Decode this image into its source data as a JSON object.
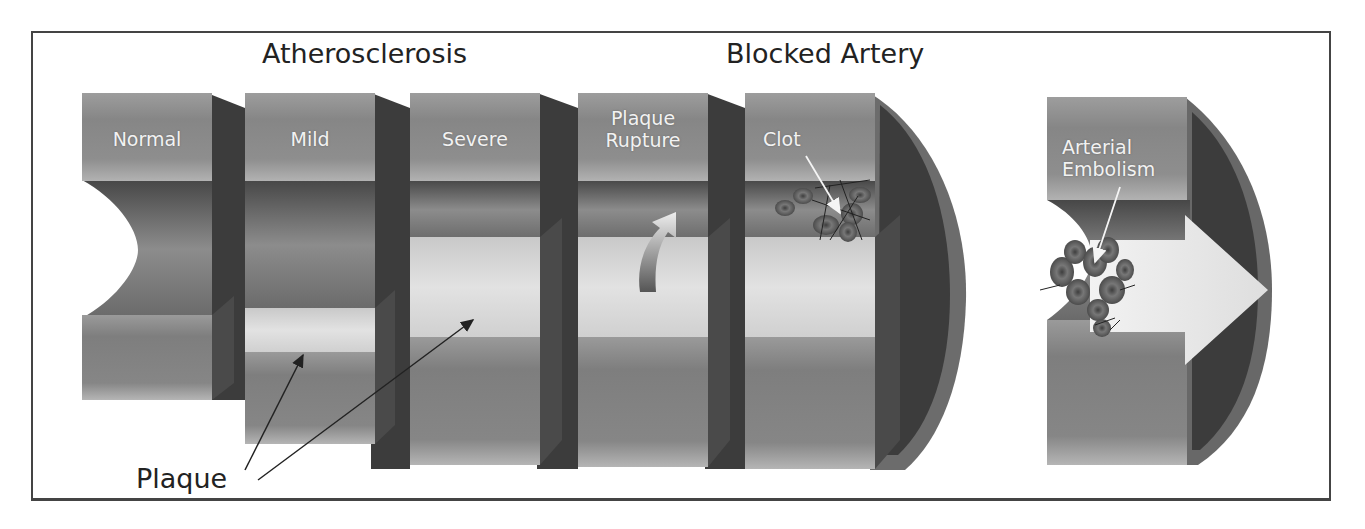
{
  "titles": {
    "atherosclerosis": "Atherosclerosis",
    "blocked_artery": "Blocked Artery"
  },
  "segments": [
    {
      "id": "normal",
      "label": "Normal"
    },
    {
      "id": "mild",
      "label": "Mild"
    },
    {
      "id": "severe",
      "label": "Severe"
    },
    {
      "id": "plaque-rupture",
      "label_line1": "Plaque",
      "label_line2": "Rupture"
    },
    {
      "id": "clot",
      "label": "Clot"
    },
    {
      "id": "arterial-embolism",
      "label_line1": "Arterial",
      "label_line2": "Embolism"
    }
  ],
  "annotations": {
    "plaque": "Plaque"
  },
  "colors": {
    "wall_outer": "#8a8a8a",
    "wall_mid": "#6e6e6e",
    "wall_light": "#b4b4b4",
    "wall_dark": "#3a3a3a",
    "lumen": "#555555",
    "plaque": "#dcdcdc",
    "blood_cell": "#5a5a5a",
    "flow_arrow": "#e6e6e6",
    "border": "#444444",
    "text_dark": "#222222",
    "text_light": "#f2f2f2"
  }
}
